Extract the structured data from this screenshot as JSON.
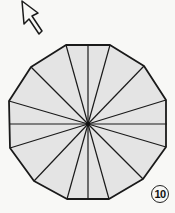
{
  "diagram": {
    "type": "folding-step",
    "shape": "dodecagon",
    "center": [
      88,
      124
    ],
    "vertices": [
      [
        66,
        45
      ],
      [
        110,
        45
      ],
      [
        144,
        66
      ],
      [
        166,
        100
      ],
      [
        166,
        147
      ],
      [
        143,
        179
      ],
      [
        109,
        199
      ],
      [
        67,
        199
      ],
      [
        34,
        181
      ],
      [
        10,
        148
      ],
      [
        9,
        101
      ],
      [
        31,
        67
      ]
    ],
    "extra_radial_endpoints": [
      [
        88,
        44
      ],
      [
        167,
        124
      ],
      [
        88,
        199
      ],
      [
        9,
        124
      ]
    ],
    "fill_color": "#e4e4e4",
    "stroke_color": "#1a1a1a",
    "background_color": "#f8f8f6",
    "arrow": {
      "icon": "arrow-pointer-outline",
      "direction": "up-left"
    },
    "step_number": "10"
  }
}
